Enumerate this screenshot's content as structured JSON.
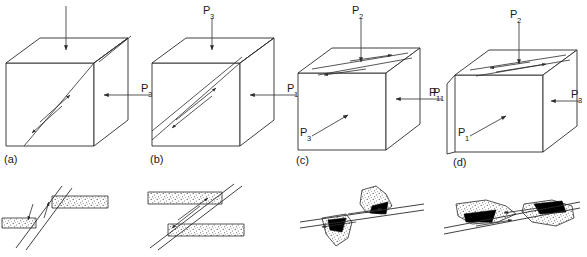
{
  "figure": {
    "domain": "structural-geology-diagram",
    "background_color": "#ffffff",
    "line_color": "#2b2b2b",
    "fill_black": "#000000",
    "stipple_color": "#4a4a4a"
  },
  "stress_symbols": {
    "p": "P",
    "sub1": "1",
    "sub2": "2",
    "sub3": "3"
  },
  "panels": [
    {
      "tag": "(a)",
      "id": "panel-a",
      "description": "Cube with inclined shear plane cutting front face, unlabelled vertical load arrow on top and P3 compression from the right",
      "arrows": [
        {
          "name": "top-load-arrow",
          "label": "",
          "sub": "",
          "direction": "down",
          "position": "top"
        },
        {
          "name": "right-stress-arrow",
          "label": "P",
          "sub": "3",
          "direction": "left",
          "position": "right"
        }
      ],
      "shear_sense": "oblique slip along steep plane on front face"
    },
    {
      "tag": "(b)",
      "id": "panel-b",
      "description": "Cube with gently inclined shear plane across front face, P3 vertical from top and P1 horizontal from the right",
      "arrows": [
        {
          "name": "top-stress-arrow",
          "label": "P",
          "sub": "3",
          "direction": "down",
          "position": "top"
        },
        {
          "name": "right-stress-arrow",
          "label": "P",
          "sub": "1",
          "direction": "left",
          "position": "right"
        }
      ],
      "shear_sense": "top-to-the-right / bottom-to-the-left couple"
    },
    {
      "tag": "(c)",
      "id": "panel-c",
      "description": "Cube with shear plane on the top face, P2 vertical from top, P1 horizontal from the right, P3 directed up-to-the-right from lower left",
      "arrows": [
        {
          "name": "top-stress-arrow",
          "label": "P",
          "sub": "2",
          "direction": "down",
          "position": "top"
        },
        {
          "name": "right-stress-arrow",
          "label": "P",
          "sub": "1",
          "direction": "left",
          "position": "right"
        },
        {
          "name": "front-stress-arrow",
          "label": "P",
          "sub": "3",
          "direction": "up-right",
          "position": "front-face"
        }
      ],
      "shear_sense": "dextral couple on top face"
    },
    {
      "tag": "(d)",
      "id": "panel-d",
      "description": "Cube with shear plane on the top face, P2 vertical from top, P3 horizontal from the right, P1 directed up-to-the-right from the front face and P1 marked on the left edge",
      "arrows": [
        {
          "name": "top-stress-arrow",
          "label": "P",
          "sub": "2",
          "direction": "down",
          "position": "top"
        },
        {
          "name": "right-stress-arrow",
          "label": "P",
          "sub": "3",
          "direction": "left",
          "position": "right"
        },
        {
          "name": "front-stress-arrow",
          "label": "P",
          "sub": "1",
          "direction": "up-right",
          "position": "front-face"
        },
        {
          "name": "left-stress-label",
          "label": "P",
          "sub": "1",
          "direction": "none",
          "position": "left-edge"
        }
      ],
      "shear_sense": "sinistral couple on top face"
    }
  ],
  "sections": [
    {
      "id": "section-a",
      "name": "offset-stippled-bed-steep-fault",
      "description": "Steeply inclined fault pair offsetting a stippled marker bed; left block down, right block up",
      "marker_bed_pattern": "stipple",
      "slip_sense": "normal-oblique, left block down"
    },
    {
      "id": "section-b",
      "name": "offset-stippled-bed-inclined-fault",
      "description": "Inclined fault offsetting a stippled marker bed; upper bed displaced to the left relative to lower bed",
      "marker_bed_pattern": "stipple",
      "slip_sense": "reverse-oblique couple"
    },
    {
      "id": "section-c",
      "name": "dragged-lens-black-infill-left",
      "description": "Gently inclined fault with dragged stippled lenses and black vein infill above and below the fault trace",
      "marker_bed_pattern": "stipple-with-black-infill",
      "slip_sense": "dextral drag"
    },
    {
      "id": "section-d",
      "name": "dragged-lens-black-infill-right",
      "description": "Gently inclined fault with dragged stippled lenses and black vein infill, opposite drag sense to section-c",
      "marker_bed_pattern": "stipple-with-black-infill",
      "slip_sense": "sinistral drag"
    }
  ]
}
